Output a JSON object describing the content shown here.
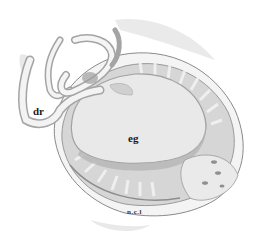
{
  "figure": {
    "type": "scientific illustration",
    "labels": {
      "dr": "dr",
      "eg": "eg",
      "ncl": "n.c.l"
    },
    "colors": {
      "background": "#ffffff",
      "outline": "#8a8a8a",
      "fill_light": "#e8e8e8",
      "fill_mid": "#cfcfcf",
      "fill_dark": "#a9a9a9"
    }
  }
}
